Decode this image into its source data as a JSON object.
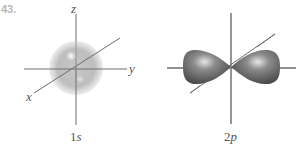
{
  "problem_number": "43.",
  "orbitals": [
    {
      "name": "1s",
      "caption": "1s",
      "shape": "sphere",
      "axis_labels": {
        "z": "z",
        "y": "y",
        "x": "x"
      }
    },
    {
      "name": "2p",
      "caption": "2p",
      "shape": "dumbbell",
      "axis_labels": {}
    }
  ],
  "colors": {
    "axis": "#6e6e6e",
    "sphere_fill": "#b5b5b5",
    "lobe_fill": "#6f6f6f",
    "text": "#555555",
    "number": "#b8b8b8"
  }
}
